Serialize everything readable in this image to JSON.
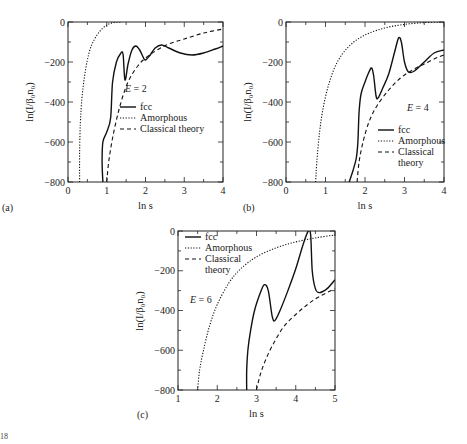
{
  "chart_data": [
    {
      "type": "line",
      "panel": "(a)",
      "annotation": "E = 2",
      "xlabel": "ln s",
      "ylabel": "ln(I/β0n0)",
      "xlim": [
        0,
        4
      ],
      "ylim": [
        -800,
        0
      ],
      "xticks": [
        "0",
        "1",
        "2",
        "3",
        "4"
      ],
      "yticks": [
        "0",
        "-200",
        "-400",
        "-600",
        "-800"
      ],
      "legend": [
        "fcc",
        "Amorphous",
        "Classical theory"
      ],
      "legend_position": "center-right",
      "series": [
        {
          "name": "fcc",
          "style": "solid",
          "points": [
            [
              0.9,
              -800
            ],
            [
              0.88,
              -700
            ],
            [
              0.9,
              -600
            ],
            [
              1.0,
              -550
            ],
            [
              1.1,
              -480
            ],
            [
              1.15,
              -300
            ],
            [
              1.25,
              -200
            ],
            [
              1.35,
              -160
            ],
            [
              1.42,
              -160
            ],
            [
              1.47,
              -290
            ],
            [
              1.55,
              -210
            ],
            [
              1.65,
              -140
            ],
            [
              1.75,
              -120
            ],
            [
              1.85,
              -140
            ],
            [
              1.95,
              -180
            ],
            [
              2.0,
              -190
            ],
            [
              2.1,
              -170
            ],
            [
              2.25,
              -130
            ],
            [
              2.42,
              -115
            ],
            [
              2.6,
              -130
            ],
            [
              2.9,
              -155
            ],
            [
              3.2,
              -165
            ],
            [
              3.5,
              -155
            ],
            [
              3.8,
              -135
            ],
            [
              4.0,
              -120
            ]
          ]
        },
        {
          "name": "Amorphous",
          "style": "dotted",
          "points": [
            [
              0.3,
              -800
            ],
            [
              0.3,
              -650
            ],
            [
              0.32,
              -500
            ],
            [
              0.36,
              -380
            ],
            [
              0.42,
              -280
            ],
            [
              0.5,
              -190
            ],
            [
              0.6,
              -120
            ],
            [
              0.75,
              -65
            ],
            [
              0.9,
              -30
            ],
            [
              1.05,
              -10
            ],
            [
              1.2,
              -2
            ],
            [
              1.4,
              0
            ]
          ]
        },
        {
          "name": "Classical theory",
          "style": "dashed",
          "points": [
            [
              1.0,
              -800
            ],
            [
              1.05,
              -700
            ],
            [
              1.15,
              -580
            ],
            [
              1.3,
              -450
            ],
            [
              1.45,
              -350
            ],
            [
              1.6,
              -280
            ],
            [
              1.8,
              -220
            ],
            [
              2.0,
              -180
            ],
            [
              2.3,
              -140
            ],
            [
              2.6,
              -110
            ],
            [
              3.0,
              -85
            ],
            [
              3.5,
              -55
            ],
            [
              4.0,
              -35
            ]
          ]
        }
      ]
    },
    {
      "type": "line",
      "panel": "(b)",
      "annotation": "E = 4",
      "xlabel": "ln s",
      "ylabel": "ln(I/β0n0)",
      "xlim": [
        0,
        4
      ],
      "ylim": [
        -800,
        0
      ],
      "xticks": [
        "0",
        "1",
        "2",
        "3",
        "4"
      ],
      "yticks": [
        "0",
        "-200",
        "-400",
        "-600",
        "-800"
      ],
      "legend": [
        "fcc",
        "Amorphous",
        "Classical theory"
      ],
      "legend_position": "lower-right",
      "series": [
        {
          "name": "fcc",
          "style": "solid",
          "points": [
            [
              1.6,
              -800
            ],
            [
              1.7,
              -740
            ],
            [
              1.78,
              -680
            ],
            [
              1.82,
              -600
            ],
            [
              1.85,
              -450
            ],
            [
              1.9,
              -360
            ],
            [
              2.0,
              -300
            ],
            [
              2.1,
              -250
            ],
            [
              2.17,
              -230
            ],
            [
              2.22,
              -270
            ],
            [
              2.28,
              -370
            ],
            [
              2.33,
              -380
            ],
            [
              2.45,
              -330
            ],
            [
              2.6,
              -260
            ],
            [
              2.75,
              -150
            ],
            [
              2.85,
              -80
            ],
            [
              2.92,
              -100
            ],
            [
              3.0,
              -200
            ],
            [
              3.1,
              -250
            ],
            [
              3.25,
              -245
            ],
            [
              3.5,
              -200
            ],
            [
              3.75,
              -155
            ],
            [
              4.0,
              -140
            ]
          ]
        },
        {
          "name": "Amorphous",
          "style": "dotted",
          "points": [
            [
              0.75,
              -800
            ],
            [
              0.78,
              -700
            ],
            [
              0.85,
              -550
            ],
            [
              0.95,
              -420
            ],
            [
              1.1,
              -300
            ],
            [
              1.3,
              -200
            ],
            [
              1.6,
              -120
            ],
            [
              2.0,
              -65
            ],
            [
              2.5,
              -30
            ],
            [
              3.0,
              -12
            ],
            [
              3.5,
              -3
            ],
            [
              4.0,
              0
            ]
          ]
        },
        {
          "name": "Classical theory",
          "style": "dashed",
          "points": [
            [
              1.8,
              -800
            ],
            [
              1.85,
              -700
            ],
            [
              1.95,
              -600
            ],
            [
              2.1,
              -500
            ],
            [
              2.3,
              -420
            ],
            [
              2.6,
              -340
            ],
            [
              2.9,
              -280
            ],
            [
              3.2,
              -240
            ],
            [
              3.5,
              -210
            ],
            [
              3.8,
              -180
            ],
            [
              4.0,
              -165
            ]
          ]
        }
      ]
    },
    {
      "type": "line",
      "panel": "(c)",
      "annotation": "E = 6",
      "xlabel": "ln s",
      "ylabel": "ln(I/β0n0)",
      "xlim": [
        1,
        5
      ],
      "ylim": [
        -800,
        0
      ],
      "xticks": [
        "1",
        "2",
        "3",
        "4",
        "5"
      ],
      "yticks": [
        "0",
        "-200",
        "-400",
        "-600",
        "-800"
      ],
      "legend": [
        "fcc",
        "Amorphous",
        "Classical theory"
      ],
      "legend_position": "upper-left",
      "series": [
        {
          "name": "fcc",
          "style": "solid",
          "points": [
            [
              2.75,
              -800
            ],
            [
              2.75,
              -700
            ],
            [
              2.78,
              -600
            ],
            [
              2.85,
              -500
            ],
            [
              2.95,
              -400
            ],
            [
              3.1,
              -310
            ],
            [
              3.2,
              -270
            ],
            [
              3.3,
              -300
            ],
            [
              3.4,
              -430
            ],
            [
              3.47,
              -450
            ],
            [
              3.6,
              -400
            ],
            [
              3.8,
              -300
            ],
            [
              4.0,
              -190
            ],
            [
              4.2,
              -60
            ],
            [
              4.32,
              0
            ],
            [
              4.38,
              -20
            ],
            [
              4.42,
              -200
            ],
            [
              4.5,
              -290
            ],
            [
              4.6,
              -310
            ],
            [
              4.8,
              -290
            ],
            [
              5.0,
              -245
            ]
          ]
        },
        {
          "name": "Amorphous",
          "style": "dotted",
          "points": [
            [
              1.5,
              -800
            ],
            [
              1.55,
              -700
            ],
            [
              1.65,
              -600
            ],
            [
              1.8,
              -480
            ],
            [
              2.0,
              -370
            ],
            [
              2.3,
              -260
            ],
            [
              2.6,
              -190
            ],
            [
              3.0,
              -130
            ],
            [
              3.5,
              -85
            ],
            [
              4.0,
              -55
            ],
            [
              4.5,
              -35
            ],
            [
              5.0,
              -20
            ]
          ]
        },
        {
          "name": "Classical theory",
          "style": "dashed",
          "points": [
            [
              3.0,
              -800
            ],
            [
              3.1,
              -720
            ],
            [
              3.25,
              -640
            ],
            [
              3.45,
              -560
            ],
            [
              3.7,
              -480
            ],
            [
              4.0,
              -420
            ],
            [
              4.3,
              -370
            ],
            [
              4.6,
              -330
            ],
            [
              5.0,
              -290
            ]
          ]
        }
      ]
    }
  ],
  "panels": {
    "a": {
      "tag": "(a)",
      "annotation": "E = 2",
      "xlabel": "ln s",
      "ylabel": "ln(I/β₀n₀)",
      "legend": [
        "fcc",
        "Amorphous",
        "Classical theory"
      ]
    },
    "b": {
      "tag": "(b)",
      "annotation": "E = 4",
      "xlabel": "ln s",
      "ylabel": "ln(I/β₀n₀)",
      "legend": [
        "fcc",
        "Amorphous",
        "Classical",
        "theory"
      ]
    },
    "c": {
      "tag": "(c)",
      "annotation": "E = 6",
      "xlabel": "ln s",
      "ylabel": "ln(I/β₀n₀)",
      "legend": [
        "fcc",
        "Amorphous",
        "Classical",
        "theory"
      ]
    }
  },
  "footer": "18"
}
